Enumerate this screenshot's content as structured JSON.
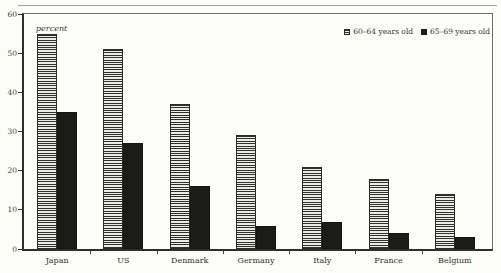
{
  "chart_data": {
    "type": "bar",
    "title": "",
    "ylabel": "percent",
    "xlabel": "",
    "categories": [
      "Japan",
      "US",
      "Denmark",
      "Germany",
      "Italy",
      "France",
      "Belgium"
    ],
    "series": [
      {
        "name": "60–64 years old",
        "style": "striped",
        "values": [
          55,
          51,
          37,
          29,
          21,
          18,
          14
        ]
      },
      {
        "name": "65–69 years old",
        "style": "solid",
        "values": [
          35,
          27,
          16,
          6,
          7,
          4,
          3
        ]
      }
    ],
    "ylim": [
      0,
      60
    ],
    "yticks": [
      0,
      10,
      20,
      30,
      40,
      50,
      60
    ],
    "grid": false,
    "legend_position": "top-right-inside",
    "colors": {
      "background": "#fcfcf8",
      "striped_bar_line": "#30302d",
      "striped_bar_fill": "#ecece6",
      "solid_bar": "#1b1b1a",
      "axis": "#2f2f2c"
    }
  }
}
